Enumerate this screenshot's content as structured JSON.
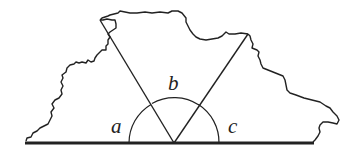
{
  "diagram": {
    "angle_labels": {
      "a": "a",
      "b": "b",
      "c": "c"
    },
    "colors": {
      "stroke": "#222222",
      "background": "#ffffff"
    }
  }
}
